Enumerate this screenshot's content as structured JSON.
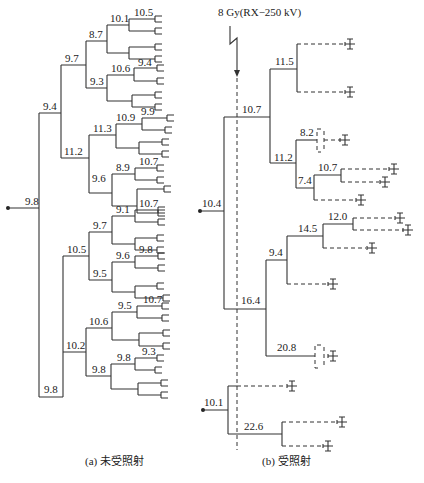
{
  "panel_a": {
    "caption": "(a) 未受照射",
    "root_label": "9.8",
    "node_labels": {
      "upper": "9.4",
      "upper_a": "9.7",
      "upper_a_a": "8.7",
      "upper_a_a_a": "10.1",
      "upper_a_a_a_a": "10.5",
      "upper_a_b": "9.3",
      "upper_a_b_a": "10.6",
      "upper_a_b_a_a": "9.4",
      "upper_b": "11.2",
      "upper_b_a": "11.3",
      "upper_b_a_a": "10.9",
      "upper_b_a_a_a": "9.9",
      "upper_b_b": "9.6",
      "upper_b_b_a": "8.9",
      "upper_b_b_a_a": "10.7",
      "lower": "9.8",
      "lower_a": "10.5",
      "lower_a_a": "9.7",
      "lower_a_a_a": "9.1",
      "lower_a_a_a_a": "10.7",
      "lower_a_b": "9.5",
      "lower_a_b_a": "9.6",
      "lower_a_b_a_a": "9.8",
      "lower_b": "10.2",
      "lower_b_a": "10.6",
      "lower_b_a_a": "9.5",
      "lower_b_a_a_a": "10.7",
      "lower_b_b": "9.8",
      "lower_b_b_a": "9.8",
      "lower_b_b_a_a": "9.3"
    }
  },
  "panel_b": {
    "caption": "(b) 受照射",
    "irradiation_label": "8 Gy(RX−250 kV)",
    "lineage1": {
      "root_label": "10.4",
      "node_labels": {
        "a": "10.7",
        "a_a": "11.5",
        "a_b": "11.2",
        "a_b_a": "8.2",
        "a_b_b": "7.4",
        "a_b_b_a": "10.7",
        "b": "16.4",
        "b_a": "9.4",
        "b_a_a": "14.5",
        "b_a_a_a": "12.0",
        "b_b": "20.8"
      }
    },
    "lineage2": {
      "root_label": "10.1",
      "node_labels": {
        "b": "22.6"
      }
    },
    "legend_symbols": {
      "dead_cell": "cross-with-bars-icon"
    }
  }
}
